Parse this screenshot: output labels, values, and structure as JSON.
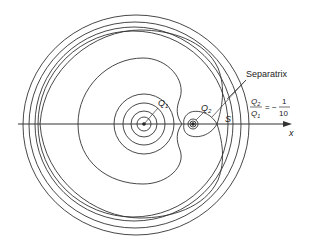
{
  "diagram": {
    "labels": {
      "separatrix": "Separatrix",
      "q1": "Q",
      "q1_sub": "1",
      "q2": "Q",
      "q2_sub": "2",
      "saddle": "S",
      "axis": "x",
      "ratio_num": "Q",
      "ratio_num_sub": "2",
      "ratio_den": "Q",
      "ratio_den_sub": "1",
      "ratio_eq": "= −",
      "ratio_value_num": "1",
      "ratio_value_den": "10"
    },
    "ratio": "Q2/Q1 = -1/10",
    "colors": {
      "line": "#333333",
      "background": "#ffffff"
    }
  }
}
